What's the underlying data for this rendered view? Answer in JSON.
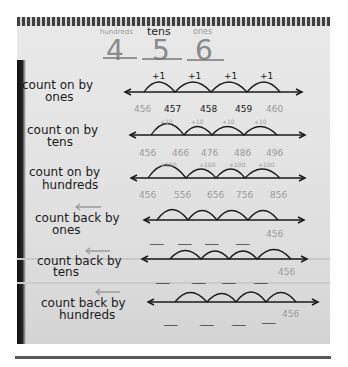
{
  "header": {
    "place_labels": [
      "hundreds",
      "tens",
      "ones"
    ],
    "digits": [
      "4",
      "5",
      "6"
    ]
  },
  "rows": [
    {
      "label_line1": "count on by",
      "label_line2": "ones",
      "direction": "forward",
      "jump": "+1",
      "values": [
        "456",
        "457",
        "458",
        "459",
        "460"
      ]
    },
    {
      "label_line1": "count on by",
      "label_line2": "tens",
      "direction": "forward",
      "jump": "+10",
      "values": [
        "456",
        "466",
        "476",
        "486",
        "496"
      ]
    },
    {
      "label_line1": "count on by",
      "label_line2": "hundreds",
      "direction": "forward",
      "jump": "+100",
      "values": [
        "456",
        "556",
        "656",
        "756",
        "856"
      ]
    },
    {
      "label_line1": "count back by",
      "label_line2": "ones",
      "direction": "backward",
      "blanks": [
        "___",
        "___",
        "___",
        "___"
      ],
      "start_value": "456"
    },
    {
      "label_line1": "count back by",
      "label_line2": "tens",
      "direction": "backward",
      "blanks": [
        "___",
        "___",
        "___",
        "___"
      ],
      "start_value": "456"
    },
    {
      "label_line1": "count back by",
      "label_line2": "hundreds",
      "direction": "backward",
      "blanks": [
        "___",
        "___",
        "___",
        "___"
      ],
      "start_value": "456"
    }
  ],
  "colors": {
    "ink": "#1a1a1a",
    "pencil_gray": "#9a9a9a",
    "paper": "#e4e4e4"
  }
}
